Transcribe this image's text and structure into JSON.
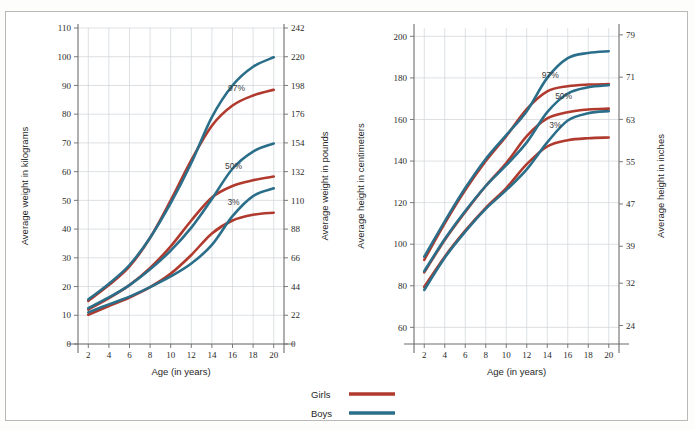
{
  "figure": {
    "background_color": "#ffffff",
    "frame_color": "#b9b9b7"
  },
  "legend": {
    "items": [
      {
        "label": "Girls",
        "color": "#b03a2e"
      },
      {
        "label": "Boys",
        "color": "#2b6e8a"
      }
    ]
  },
  "chart_data": [
    {
      "type": "line",
      "id": "weight-chart",
      "title": "",
      "xlabel": "Age (in years)",
      "ylabel": "Average weight in kilograms",
      "ylabel_right": "Average weight in pounds",
      "xlim": [
        1,
        21
      ],
      "ylim": [
        0,
        110
      ],
      "ylim_right": [
        0,
        242
      ],
      "grid": true,
      "legend_position": "bottom-center",
      "xticks": [
        2,
        4,
        6,
        8,
        10,
        12,
        14,
        16,
        18,
        20
      ],
      "yticks": [
        0,
        10,
        20,
        30,
        40,
        50,
        60,
        70,
        80,
        90,
        100,
        110
      ],
      "yticks_right": [
        0,
        22,
        44,
        66,
        88,
        110,
        132,
        154,
        176,
        198,
        220,
        242
      ],
      "annotations": [
        {
          "text": "97%",
          "x": 16.4,
          "y": 88
        },
        {
          "text": "50%",
          "x": 16.1,
          "y": 61
        },
        {
          "text": "3%",
          "x": 16.1,
          "y": 48.5
        }
      ],
      "x": [
        2,
        4,
        6,
        8,
        10,
        12,
        14,
        16,
        18,
        20
      ],
      "series": [
        {
          "name": "Girls 97%",
          "color": "#b03a2e",
          "values": [
            15.0,
            20.5,
            27.0,
            37.0,
            50.0,
            64.0,
            76.0,
            83.0,
            86.5,
            88.5
          ]
        },
        {
          "name": "Boys 97%",
          "color": "#2b6e8a",
          "values": [
            15.5,
            21.0,
            27.5,
            37.0,
            49.0,
            63.0,
            79.0,
            90.0,
            96.5,
            99.8
          ]
        },
        {
          "name": "Girls 50%",
          "color": "#b03a2e",
          "values": [
            12.0,
            16.0,
            20.5,
            26.5,
            34.0,
            43.0,
            51.0,
            55.0,
            57.0,
            58.3
          ]
        },
        {
          "name": "Boys 50%",
          "color": "#2b6e8a",
          "values": [
            12.5,
            16.2,
            20.5,
            26.0,
            32.5,
            40.5,
            50.5,
            61.0,
            67.0,
            69.8
          ]
        },
        {
          "name": "Girls 3%",
          "color": "#b03a2e",
          "values": [
            10.2,
            13.2,
            16.2,
            19.8,
            24.5,
            31.0,
            38.5,
            43.0,
            45.0,
            45.7
          ]
        },
        {
          "name": "Boys 3%",
          "color": "#2b6e8a",
          "values": [
            11.0,
            13.8,
            16.5,
            19.8,
            23.5,
            28.0,
            34.5,
            44.5,
            51.5,
            54.2
          ]
        }
      ]
    },
    {
      "type": "line",
      "id": "height-chart",
      "title": "",
      "xlabel": "Age (in years)",
      "ylabel": "Average height in centimeters",
      "ylabel_right": "Average height in inches",
      "xlim": [
        1,
        21
      ],
      "ylim": [
        52,
        204
      ],
      "ylim_right": [
        20.5,
        80.3
      ],
      "grid": true,
      "legend_position": "bottom-center",
      "xticks": [
        2,
        4,
        6,
        8,
        10,
        12,
        14,
        16,
        18,
        20
      ],
      "yticks": [
        60,
        80,
        100,
        120,
        140,
        160,
        180,
        200
      ],
      "yticks_right": [
        24,
        32,
        39,
        47,
        55,
        63,
        71,
        79
      ],
      "annotations": [
        {
          "text": "97%",
          "x": 14.3,
          "y": 180
        },
        {
          "text": "50%",
          "x": 15.6,
          "y": 170
        },
        {
          "text": "3%",
          "x": 14.8,
          "y": 156
        }
      ],
      "x": [
        2,
        4,
        6,
        8,
        10,
        12,
        14,
        16,
        18,
        20
      ],
      "series": [
        {
          "name": "Girls 97%",
          "color": "#b03a2e",
          "values": [
            92.5,
            110.0,
            126.0,
            140.0,
            152.0,
            165.0,
            173.5,
            176.0,
            176.8,
            177.0
          ]
        },
        {
          "name": "Boys 97%",
          "color": "#2b6e8a",
          "values": [
            94.0,
            111.0,
            127.0,
            141.0,
            152.5,
            164.0,
            180.0,
            189.5,
            192.0,
            192.8
          ]
        },
        {
          "name": "Girls 50%",
          "color": "#b03a2e",
          "values": [
            86.5,
            102.0,
            115.5,
            128.0,
            139.0,
            152.0,
            160.5,
            163.5,
            164.8,
            165.2
          ]
        },
        {
          "name": "Boys 50%",
          "color": "#2b6e8a",
          "values": [
            87.0,
            102.5,
            116.0,
            128.0,
            138.0,
            149.0,
            163.5,
            172.5,
            175.5,
            176.5
          ]
        },
        {
          "name": "Girls 3%",
          "color": "#b03a2e",
          "values": [
            79.5,
            94.0,
            106.5,
            117.5,
            127.0,
            138.5,
            147.0,
            150.0,
            151.0,
            151.3
          ]
        },
        {
          "name": "Boys 3%",
          "color": "#2b6e8a",
          "values": [
            78.0,
            93.5,
            106.0,
            117.0,
            126.0,
            136.0,
            149.0,
            159.5,
            163.0,
            164.0
          ]
        }
      ]
    }
  ]
}
